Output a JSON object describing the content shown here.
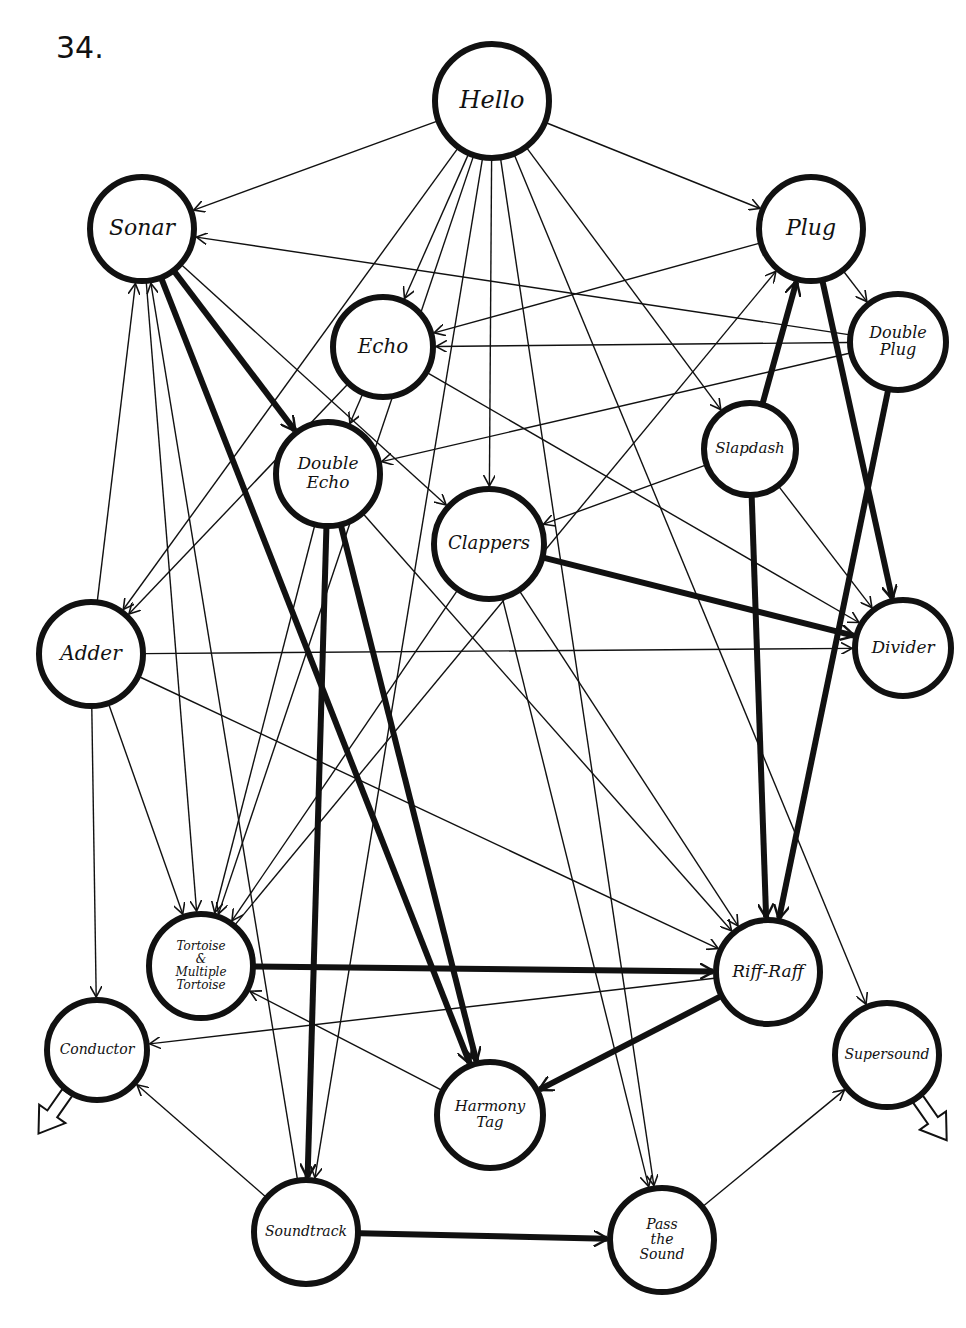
{
  "page": {
    "number": "34."
  },
  "diagram": {
    "nodes": [
      {
        "id": "hello",
        "label": [
          "Hello"
        ],
        "x": 492,
        "y": 101,
        "r": 57,
        "fs": 24
      },
      {
        "id": "sonar",
        "label": [
          "Sonar"
        ],
        "x": 142,
        "y": 229,
        "r": 52,
        "fs": 22
      },
      {
        "id": "plug",
        "label": [
          "Plug"
        ],
        "x": 811,
        "y": 229,
        "r": 52,
        "fs": 22
      },
      {
        "id": "echo",
        "label": [
          "Echo"
        ],
        "x": 383,
        "y": 347,
        "r": 50,
        "fs": 20
      },
      {
        "id": "double-plug",
        "label": [
          "Double",
          "Plug"
        ],
        "x": 898,
        "y": 342,
        "r": 48,
        "fs": 16
      },
      {
        "id": "slapdash",
        "label": [
          "Slapdash"
        ],
        "x": 750,
        "y": 449,
        "r": 46,
        "fs": 15
      },
      {
        "id": "double-echo",
        "label": [
          "Double",
          "Echo"
        ],
        "x": 328,
        "y": 474,
        "r": 52,
        "fs": 17
      },
      {
        "id": "clappers",
        "label": [
          "Clappers"
        ],
        "x": 489,
        "y": 544,
        "r": 55,
        "fs": 18
      },
      {
        "id": "adder",
        "label": [
          "Adder"
        ],
        "x": 91,
        "y": 654,
        "r": 52,
        "fs": 20
      },
      {
        "id": "divider",
        "label": [
          "Divider"
        ],
        "x": 903,
        "y": 648,
        "r": 48,
        "fs": 17
      },
      {
        "id": "tortoise",
        "label": [
          "Tortoise",
          "&",
          "Multiple",
          "Tortoise"
        ],
        "x": 201,
        "y": 966,
        "r": 52,
        "fs": 12
      },
      {
        "id": "riff-raff",
        "label": [
          "Riff-Raff"
        ],
        "x": 768,
        "y": 972,
        "r": 52,
        "fs": 17
      },
      {
        "id": "conductor",
        "label": [
          "Conductor"
        ],
        "x": 97,
        "y": 1050,
        "r": 50,
        "fs": 14
      },
      {
        "id": "supersound",
        "label": [
          "Supersound"
        ],
        "x": 887,
        "y": 1055,
        "r": 52,
        "fs": 14
      },
      {
        "id": "harmony-tag",
        "label": [
          "Harmony",
          "Tag"
        ],
        "x": 490,
        "y": 1115,
        "r": 53,
        "fs": 15
      },
      {
        "id": "soundtrack",
        "label": [
          "Soundtrack"
        ],
        "x": 306,
        "y": 1232,
        "r": 52,
        "fs": 14
      },
      {
        "id": "pass-the-sound",
        "label": [
          "Pass",
          "the",
          "Sound"
        ],
        "x": 662,
        "y": 1240,
        "r": 52,
        "fs": 14
      }
    ],
    "edges": [
      {
        "from": "hello",
        "to": "sonar",
        "w": "thin"
      },
      {
        "from": "hello",
        "to": "plug",
        "w": "thin"
      },
      {
        "from": "hello",
        "to": "echo",
        "w": "thin"
      },
      {
        "from": "hello",
        "to": "adder",
        "w": "thin"
      },
      {
        "from": "hello",
        "to": "clappers",
        "w": "thin"
      },
      {
        "from": "hello",
        "to": "slapdash",
        "w": "thin"
      },
      {
        "from": "hello",
        "to": "tortoise",
        "w": "thin"
      },
      {
        "from": "hello",
        "to": "soundtrack",
        "w": "thin"
      },
      {
        "from": "hello",
        "to": "pass-the-sound",
        "w": "thin"
      },
      {
        "from": "hello",
        "to": "supersound",
        "w": "thin"
      },
      {
        "from": "double-plug",
        "to": "sonar",
        "w": "thin"
      },
      {
        "from": "adder",
        "to": "sonar",
        "w": "thin"
      },
      {
        "from": "sonar",
        "to": "double-echo",
        "w": "thick"
      },
      {
        "from": "sonar",
        "to": "harmony-tag",
        "w": "thick"
      },
      {
        "from": "soundtrack",
        "to": "sonar",
        "w": "thin"
      },
      {
        "from": "sonar",
        "to": "clappers",
        "w": "thin"
      },
      {
        "from": "sonar",
        "to": "tortoise",
        "w": "thin"
      },
      {
        "from": "plug",
        "to": "double-plug",
        "w": "thin"
      },
      {
        "from": "slapdash",
        "to": "plug",
        "w": "thick"
      },
      {
        "from": "plug",
        "to": "divider",
        "w": "thick"
      },
      {
        "from": "plug",
        "to": "echo",
        "w": "thin"
      },
      {
        "from": "tortoise",
        "to": "plug",
        "w": "thin"
      },
      {
        "from": "double-plug",
        "to": "echo",
        "w": "thin"
      },
      {
        "from": "double-plug",
        "to": "double-echo",
        "w": "thin"
      },
      {
        "from": "double-plug",
        "to": "riff-raff",
        "w": "thick"
      },
      {
        "from": "echo",
        "to": "double-echo",
        "w": "thin"
      },
      {
        "from": "echo",
        "to": "adder",
        "w": "thin"
      },
      {
        "from": "echo",
        "to": "divider",
        "w": "thin"
      },
      {
        "from": "double-echo",
        "to": "soundtrack",
        "w": "thick"
      },
      {
        "from": "double-echo",
        "to": "harmony-tag",
        "w": "thick"
      },
      {
        "from": "double-echo",
        "to": "riff-raff",
        "w": "thin"
      },
      {
        "from": "slapdash",
        "to": "clappers",
        "w": "thin"
      },
      {
        "from": "slapdash",
        "to": "riff-raff",
        "w": "thick"
      },
      {
        "from": "slapdash",
        "to": "divider",
        "w": "thin"
      },
      {
        "from": "clappers",
        "to": "divider",
        "w": "thick"
      },
      {
        "from": "clappers",
        "to": "riff-raff",
        "w": "thin"
      },
      {
        "from": "clappers",
        "to": "tortoise",
        "w": "thin"
      },
      {
        "from": "clappers",
        "to": "pass-the-sound",
        "w": "thin"
      },
      {
        "from": "adder",
        "to": "divider",
        "w": "thin"
      },
      {
        "from": "adder",
        "to": "conductor",
        "w": "thin"
      },
      {
        "from": "adder",
        "to": "tortoise",
        "w": "thin"
      },
      {
        "from": "adder",
        "to": "riff-raff",
        "w": "thin"
      },
      {
        "from": "tortoise",
        "to": "riff-raff",
        "w": "thick"
      },
      {
        "from": "harmony-tag",
        "to": "tortoise",
        "w": "thin"
      },
      {
        "from": "riff-raff",
        "to": "conductor",
        "w": "thin"
      },
      {
        "from": "riff-raff",
        "to": "harmony-tag",
        "w": "thick"
      },
      {
        "from": "soundtrack",
        "to": "conductor",
        "w": "thin"
      },
      {
        "from": "soundtrack",
        "to": "pass-the-sound",
        "w": "thick"
      },
      {
        "from": "pass-the-sound",
        "to": "supersound",
        "w": "thin"
      },
      {
        "from": "double-echo",
        "to": "tortoise",
        "w": "thin"
      }
    ],
    "exit_arrows": [
      {
        "node": "conductor",
        "direction": "down-left"
      },
      {
        "node": "supersound",
        "direction": "down-right"
      }
    ]
  }
}
